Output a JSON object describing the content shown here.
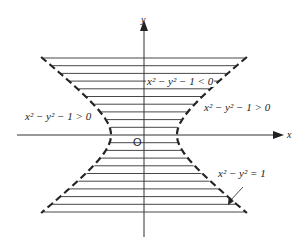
{
  "diagram": {
    "type": "hyperbola-region",
    "axes": {
      "x_label": "x",
      "y_label": "y",
      "origin_label": "O"
    },
    "labels": {
      "left_region": "x² − y² − 1 > 0",
      "right_region": "x² − y² − 1 > 0",
      "inner_region": "x² − y² − 1 < 0",
      "curve": "x² − y² = 1"
    },
    "colors": {
      "ink": "#222222",
      "background": "#ffffff"
    },
    "hatch_lines_above_axis": 10,
    "hatch_lines_below_axis": 10
  }
}
